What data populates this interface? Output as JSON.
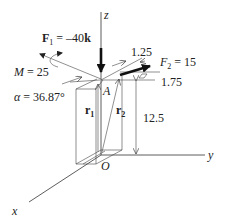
{
  "diagram": {
    "axes": {
      "z": "z",
      "y": "y",
      "x": "x",
      "origin": "O"
    },
    "point_a": "A",
    "forces": {
      "f1": {
        "symbol": "F",
        "subscript": "1",
        "value": " = –40",
        "unit_vector": "k"
      },
      "f2": {
        "symbol": "F",
        "subscript": "2",
        "value": " = 15"
      }
    },
    "moment": {
      "symbol": "M",
      "value": " = 25"
    },
    "angle": {
      "symbol": "α",
      "value": " = 36.87°"
    },
    "position_vectors": {
      "r1": {
        "symbol": "r",
        "subscript": "1"
      },
      "r2": {
        "symbol": "r",
        "subscript": "2"
      }
    },
    "dimensions": {
      "d1": "1.25",
      "d2": "1.75",
      "height": "12.5"
    }
  }
}
